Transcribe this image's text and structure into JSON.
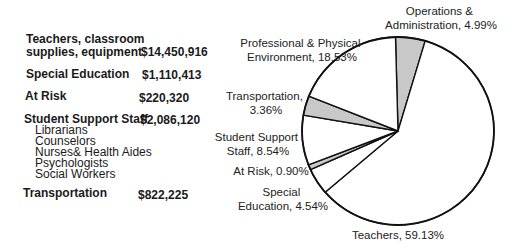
{
  "table": {
    "rows": [
      {
        "label_line1": "Teachers, classroom",
        "label_line2": "supplies, equipment",
        "value": "$14,450,916"
      },
      {
        "label_line1": "Special Education",
        "value": "$1,110,413"
      },
      {
        "label_line1": "At Risk",
        "value": "$220,320"
      },
      {
        "label_line1": "Student Support Staff",
        "value": "$2,086,120",
        "sub_items": [
          "Librarians",
          "Counselors",
          "Nurses& Health Aides",
          "Psychologists",
          "Social Workers"
        ]
      },
      {
        "label_line1": "Transportation",
        "value": "$822,225"
      }
    ]
  },
  "chart_data": {
    "type": "pie",
    "title": "",
    "start": "top, clockwise",
    "slices": [
      {
        "label": "Operations & Administration",
        "value": 4.99,
        "color": "#c8c8c8"
      },
      {
        "label": "Teachers",
        "value": 59.13,
        "color": "#ffffff"
      },
      {
        "label": "Special Education",
        "value": 4.54,
        "color": "#ffffff"
      },
      {
        "label": "At Risk",
        "value": 0.9,
        "color": "#c8c8c8"
      },
      {
        "label": "Student Support Staff",
        "value": 8.54,
        "color": "#ffffff"
      },
      {
        "label": "Transportation",
        "value": 3.36,
        "color": "#c8c8c8"
      },
      {
        "label": "Professional & Physical Environment",
        "value": 18.53,
        "color": "#ffffff"
      }
    ],
    "labels": {
      "ops": [
        "Operations &",
        "Administration, 4.99%"
      ],
      "teachers": [
        "Teachers, 59.13%"
      ],
      "sped": [
        "Special",
        "Education, 4.54%"
      ],
      "atrisk": [
        "At Risk, 0.90%"
      ],
      "support": [
        "Student Support",
        "Staff, 8.54%"
      ],
      "transport": [
        "Transportation,",
        "3.36%"
      ],
      "prof": [
        "Professional & Physical",
        "Environment, 18.53%"
      ]
    },
    "legend": "none"
  }
}
